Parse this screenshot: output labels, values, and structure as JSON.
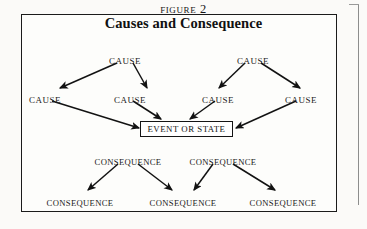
{
  "figure": {
    "number_label": "FIGURE 2",
    "title": "Causes and Consequence",
    "center_node": "EVENT OR STATE"
  },
  "rows": {
    "causes_top": [
      {
        "label": "CAUSE",
        "x": 125,
        "y": 57
      },
      {
        "label": "CAUSE",
        "x": 253,
        "y": 57
      }
    ],
    "causes_mid": [
      {
        "label": "CAUSE",
        "x": 45,
        "y": 96
      },
      {
        "label": "CAUSE",
        "x": 130,
        "y": 96
      },
      {
        "label": "CAUSE",
        "x": 218,
        "y": 96
      },
      {
        "label": "CAUSE",
        "x": 301,
        "y": 96
      }
    ],
    "consequences_mid": [
      {
        "label": "CONSEQUENCE",
        "x": 128,
        "y": 158
      },
      {
        "label": "CONSEQUENCE",
        "x": 223,
        "y": 158
      }
    ],
    "consequences_bottom": [
      {
        "label": "CONSEQUENCE",
        "x": 80,
        "y": 199
      },
      {
        "label": "CONSEQUENCE",
        "x": 183,
        "y": 199
      },
      {
        "label": "CONSEQUENCE",
        "x": 283,
        "y": 199
      }
    ]
  },
  "colors": {
    "ink": "#1a1a1a",
    "frame": "#1b1b1b",
    "paper": "#fdfdfb"
  }
}
